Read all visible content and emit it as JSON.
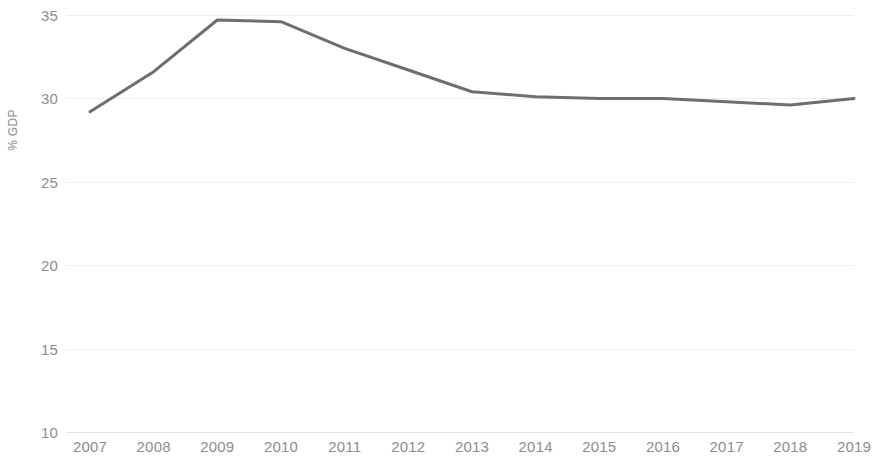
{
  "chart_data": {
    "type": "line",
    "title": "",
    "subtitle": "",
    "xlabel": "",
    "ylabel": "% GDP",
    "x": [
      2007,
      2008,
      2009,
      2010,
      2011,
      2012,
      2013,
      2014,
      2015,
      2016,
      2017,
      2018,
      2019
    ],
    "categories": [
      "2007",
      "2008",
      "2009",
      "2010",
      "2011",
      "2012",
      "2013",
      "2014",
      "2015",
      "2016",
      "2017",
      "2018",
      "2019"
    ],
    "values": [
      29.2,
      31.6,
      34.7,
      34.6,
      33.0,
      31.7,
      30.4,
      30.1,
      30.0,
      30.0,
      29.8,
      29.6,
      30.0
    ],
    "series": [
      {
        "name": "% GDP",
        "color": "#6e6e6e",
        "values": [
          29.2,
          31.6,
          34.7,
          34.6,
          33.0,
          31.7,
          30.4,
          30.1,
          30.0,
          30.0,
          29.8,
          29.6,
          30.0
        ]
      }
    ],
    "ylim": [
      10,
      35
    ],
    "yticks": [
      10,
      15,
      20,
      25,
      30,
      35
    ],
    "ytick_labels": [
      "10",
      "15",
      "20",
      "25",
      "30",
      "35"
    ],
    "xlim": [
      2007,
      2019
    ],
    "xticks": [
      2007,
      2008,
      2009,
      2010,
      2011,
      2012,
      2013,
      2014,
      2015,
      2016,
      2017,
      2018,
      2019
    ],
    "grid": true,
    "grid_axis": "y",
    "legend": false,
    "legend_position": "none",
    "line_color": "#6e6e6e",
    "line_width": 3,
    "grid_color": "#ededed",
    "tick_label_color": "#8d8d8d",
    "axis_label_color": "#8a8a8a",
    "background_color": "#ffffff",
    "annotations": []
  }
}
